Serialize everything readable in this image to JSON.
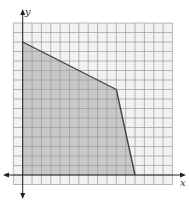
{
  "chart_data": {
    "type": "area",
    "title": "",
    "xlabel": "x",
    "ylabel": "y",
    "xlim": [
      -1,
      16
    ],
    "ylim": [
      -1,
      16
    ],
    "grid": true,
    "grid_step": 1,
    "tick_labels": false,
    "legend": null,
    "shaded_region": {
      "description": "Feasible region (shaded polygon)",
      "vertices": [
        [
          0,
          0
        ],
        [
          0,
          14
        ],
        [
          10,
          9
        ],
        [
          12,
          0
        ]
      ],
      "fill_color": "#c8c8c8",
      "edge_color": "#444444"
    },
    "boundary_lines": [
      {
        "from": [
          0,
          14
        ],
        "to": [
          10,
          9
        ]
      },
      {
        "from": [
          10,
          9
        ],
        "to": [
          12,
          0
        ]
      }
    ]
  },
  "axes": {
    "x_label": "x",
    "y_label": "y"
  },
  "colors": {
    "grid": "#9a9a9a",
    "grid_bg": "#f2f2f2",
    "region": "#c8c8c8",
    "boundary": "#444444",
    "axis": "#222222"
  }
}
